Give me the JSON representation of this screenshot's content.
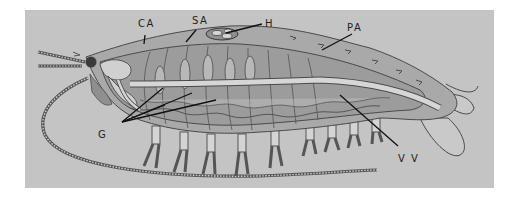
{
  "figure": {
    "background_color": "#c4c4c4",
    "body_colors": {
      "outer_shield": "#a9a9a9",
      "inner_body": "#9c9c9c",
      "gut": "#d6d6d6",
      "outline": "#4a4a4a",
      "leader_line": "#111111"
    },
    "labels": [
      {
        "id": "CA",
        "text": "CA",
        "x": 140,
        "y": 27
      },
      {
        "id": "SA",
        "text": "SA",
        "x": 193,
        "y": 24
      },
      {
        "id": "H",
        "text": "H",
        "x": 265,
        "y": 27
      },
      {
        "id": "PA",
        "text": "PA",
        "x": 347,
        "y": 30
      },
      {
        "id": "G",
        "text": "G",
        "x": 99,
        "y": 138
      },
      {
        "id": "VV",
        "text": "V V",
        "x": 400,
        "y": 162
      }
    ]
  }
}
